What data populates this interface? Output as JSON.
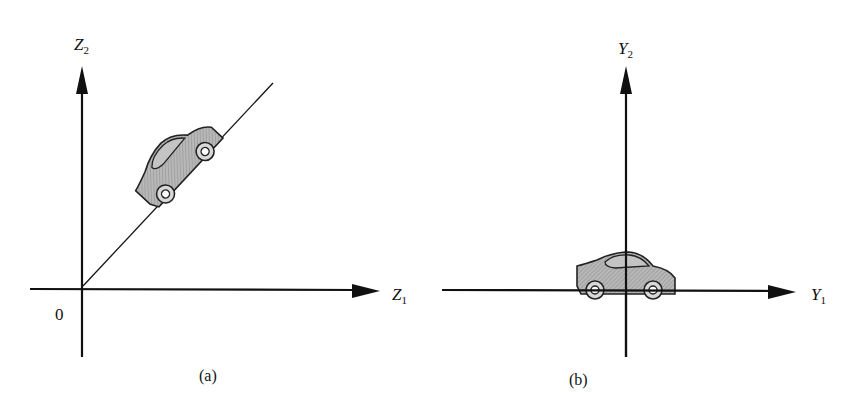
{
  "figure": {
    "panels": [
      {
        "id": "a",
        "caption": "(a)",
        "vertical_axis": {
          "var": "Z",
          "sub": "2"
        },
        "horizontal_axis": {
          "var": "Z",
          "sub": "1"
        },
        "origin_label": "0",
        "description": "Car oriented along a diagonal line through the origin"
      },
      {
        "id": "b",
        "caption": "(b)",
        "vertical_axis": {
          "var": "Y",
          "sub": "2"
        },
        "horizontal_axis": {
          "var": "Y",
          "sub": "1"
        },
        "description": "Car aligned horizontally along the Y1 axis"
      }
    ],
    "colors": {
      "ink": "#111111",
      "car_fill": "#a9a9a9",
      "background": "#ffffff"
    }
  }
}
